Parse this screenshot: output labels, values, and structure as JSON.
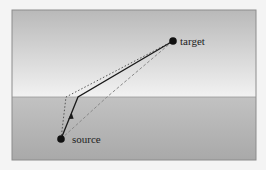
{
  "diagram": {
    "type": "refraction-path",
    "labels": {
      "source": "source",
      "target": "target"
    },
    "frame": {
      "x": 12,
      "y": 10,
      "width": 244,
      "height": 150
    },
    "interface_y": 97,
    "colors": {
      "upper_top": "#b9b9b9",
      "upper_bottom": "#f2f2f2",
      "lower_top": "#c2c2c2",
      "lower_bottom": "#a9a9a9",
      "border": "#8c8c8c",
      "solid_path": "#1a1a1a",
      "dotted_path": "#555555",
      "dashed_path": "#8a8a8a",
      "node": "#111111"
    },
    "nodes": [
      {
        "id": "source",
        "x": 61,
        "y": 139
      },
      {
        "id": "target",
        "x": 173,
        "y": 41
      }
    ],
    "paths": [
      {
        "name": "refracted-path",
        "style": "solid",
        "points": [
          [
            61,
            139
          ],
          [
            78,
            97
          ],
          [
            173,
            41
          ]
        ],
        "arrow_at": [
          71,
          116
        ]
      },
      {
        "name": "near-normal-path",
        "style": "dotted",
        "points": [
          [
            61,
            139
          ],
          [
            66,
            97
          ],
          [
            173,
            41
          ]
        ]
      },
      {
        "name": "straight-crossing-path",
        "style": "dashed",
        "points": [
          [
            61,
            139
          ],
          [
            107,
            97
          ],
          [
            173,
            41
          ]
        ]
      }
    ]
  }
}
